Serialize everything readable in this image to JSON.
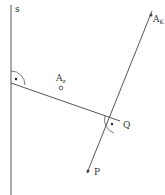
{
  "diagram": {
    "type": "geometry-construction",
    "line_s": {
      "label": "s",
      "x": 11,
      "y1": 5,
      "y2": 195
    },
    "perpendicular_segment": {
      "from": [
        11,
        83
      ],
      "to": [
        119,
        121
      ]
    },
    "oblique_line": {
      "from": [
        87,
        172
      ],
      "to": [
        152,
        12
      ]
    },
    "points": {
      "A_z": {
        "label": "A",
        "subscript": "z",
        "x": 62,
        "y": 88
      },
      "A_K": {
        "label": "A",
        "subscript": "K",
        "x": 151,
        "y": 15
      },
      "Q": {
        "label": "Q",
        "x": 119,
        "y": 121
      },
      "P": {
        "label": "P",
        "x": 88,
        "y": 170
      }
    },
    "right_angle_marks": [
      {
        "at": "intersection of s and segment",
        "x": 11,
        "y": 83
      },
      {
        "at": "Q",
        "x": 119,
        "y": 121
      }
    ],
    "colors": {
      "line": "#555555",
      "text": "#333333",
      "background": "#ffffff"
    }
  }
}
